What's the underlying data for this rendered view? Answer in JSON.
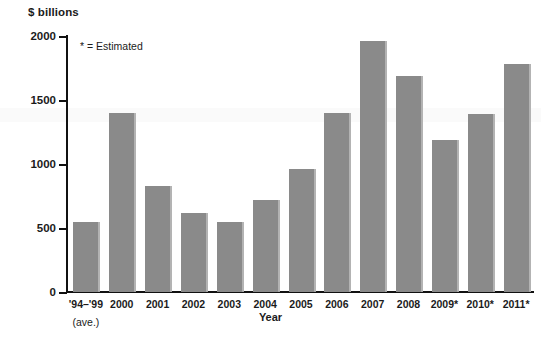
{
  "chart_data": {
    "type": "bar",
    "title": "",
    "subtitle": "",
    "xlabel": "Year",
    "ylabel": "$ billions",
    "ylim": [
      0,
      2000
    ],
    "yticks": [
      0,
      500,
      1000,
      1500,
      2000
    ],
    "ytick_labels": [
      "0",
      "500",
      "1000",
      "1500",
      "2000"
    ],
    "grid": false,
    "legend": null,
    "annotations": [
      "* = Estimated"
    ],
    "bar_color": "#8a8a8a",
    "categories": [
      "'94–'99",
      "2000",
      "2001",
      "2002",
      "2003",
      "2004",
      "2005",
      "2006",
      "2007",
      "2008",
      "2009*",
      "2010*",
      "2011*"
    ],
    "category_sublabels": [
      "(ave.)",
      "",
      "",
      "",
      "",
      "",
      "",
      "",
      "",
      "",
      "",
      "",
      ""
    ],
    "values": [
      550,
      1400,
      830,
      620,
      550,
      720,
      960,
      1400,
      1960,
      1690,
      1190,
      1390,
      1780
    ]
  },
  "axes": {
    "y_title": "$ billions",
    "x_title": "Year"
  },
  "note": {
    "estimated": "* = Estimated"
  }
}
